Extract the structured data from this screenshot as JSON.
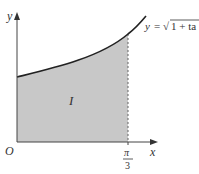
{
  "figure": {
    "curve_label": "y = √1 + ta",
    "curve_label_prefix": "y",
    "curve_label_eq": "= ",
    "curve_label_sqrt": "√",
    "curve_label_radicand": "1 + ta",
    "region_label": "I",
    "origin_label": "O",
    "x_axis_label": "x",
    "y_axis_label": "y",
    "x_tick_numerator": "π",
    "x_tick_denominator": "3",
    "colors": {
      "axis": "#444444",
      "curve": "#222222",
      "shade": "#c8c8c8",
      "dashed": "#666666"
    }
  }
}
